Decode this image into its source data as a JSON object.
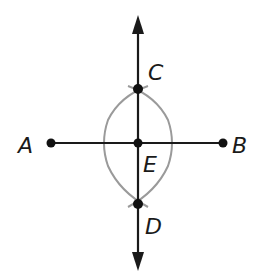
{
  "diagram": {
    "colors": {
      "line": "#1a1a1a",
      "arc": "#9a9a9a",
      "point": "#111111",
      "background": "#ffffff"
    },
    "points": [
      {
        "id": "A",
        "label": "A",
        "x": 51,
        "y": 143
      },
      {
        "id": "B",
        "label": "B",
        "x": 223,
        "y": 143
      },
      {
        "id": "C",
        "label": "C",
        "x": 138,
        "y": 89
      },
      {
        "id": "D",
        "label": "D",
        "x": 138,
        "y": 204
      },
      {
        "id": "E",
        "label": "E",
        "x": 138,
        "y": 143
      }
    ],
    "labels": {
      "A": "A",
      "B": "B",
      "C": "C",
      "D": "D",
      "E": "E"
    },
    "segment_AB": {
      "from": "A",
      "to": "B"
    },
    "line_CD": {
      "through": [
        "C",
        "D"
      ],
      "arrows": "both"
    }
  }
}
